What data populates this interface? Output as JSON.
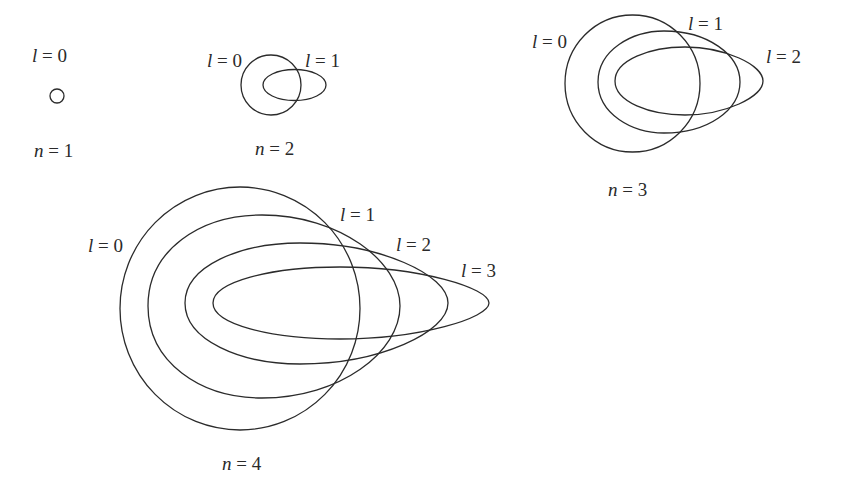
{
  "figure": {
    "stroke_color": "#2b2b2b",
    "background": "#ffffff"
  },
  "panels": [
    {
      "n_label": {
        "var": "n",
        "eq": " = 1"
      },
      "orbits": [
        {
          "l_label": {
            "var": "l",
            "eq": " = 0"
          },
          "shape": "circle"
        }
      ]
    },
    {
      "n_label": {
        "var": "n",
        "eq": " = 2"
      },
      "orbits": [
        {
          "l_label": {
            "var": "l",
            "eq": " = 0"
          },
          "shape": "circle"
        },
        {
          "l_label": {
            "var": "l",
            "eq": " = 1"
          },
          "shape": "ellipse"
        }
      ]
    },
    {
      "n_label": {
        "var": "n",
        "eq": " = 3"
      },
      "orbits": [
        {
          "l_label": {
            "var": "l",
            "eq": " = 0"
          },
          "shape": "circle"
        },
        {
          "l_label": {
            "var": "l",
            "eq": " = 1"
          },
          "shape": "ellipse"
        },
        {
          "l_label": {
            "var": "l",
            "eq": " = 2"
          },
          "shape": "ellipse"
        }
      ]
    },
    {
      "n_label": {
        "var": "n",
        "eq": " = 4"
      },
      "orbits": [
        {
          "l_label": {
            "var": "l",
            "eq": " = 0"
          },
          "shape": "circle"
        },
        {
          "l_label": {
            "var": "l",
            "eq": " = 1"
          },
          "shape": "ellipse"
        },
        {
          "l_label": {
            "var": "l",
            "eq": " = 2"
          },
          "shape": "ellipse"
        },
        {
          "l_label": {
            "var": "l",
            "eq": " = 3"
          },
          "shape": "ellipse"
        }
      ]
    }
  ]
}
